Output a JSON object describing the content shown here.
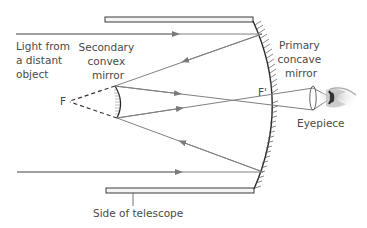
{
  "diagram": {
    "type": "cassegrain-reflecting-telescope",
    "labels": {
      "light_source": [
        "Light from",
        "a distant",
        "object"
      ],
      "secondary_mirror": [
        "Secondary",
        "convex",
        "mirror"
      ],
      "primary_mirror": [
        "Primary",
        "concave",
        "mirror"
      ],
      "eyepiece": "Eyepiece",
      "tube_side": "Side of telescope",
      "focus_secondary": "F",
      "focus_primary": "F'"
    },
    "colors": {
      "ray": "#808080",
      "outline": "#3a3a3a",
      "text": "#4a4a4a",
      "dashed": "#333333"
    }
  }
}
